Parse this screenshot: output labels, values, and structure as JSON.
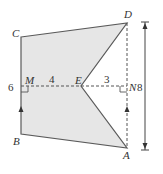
{
  "diagram": {
    "type": "geometry",
    "fill_color": "#e6e6e6",
    "stroke_color": "#555555",
    "points": {
      "A": {
        "label": "A"
      },
      "B": {
        "label": "B"
      },
      "C": {
        "label": "C"
      },
      "D": {
        "label": "D"
      },
      "E": {
        "label": "E"
      },
      "M": {
        "label": "M"
      },
      "N": {
        "label": "N"
      }
    },
    "measurements": {
      "BC": "6",
      "ME": "4",
      "EN": "3",
      "AD": "8"
    }
  }
}
